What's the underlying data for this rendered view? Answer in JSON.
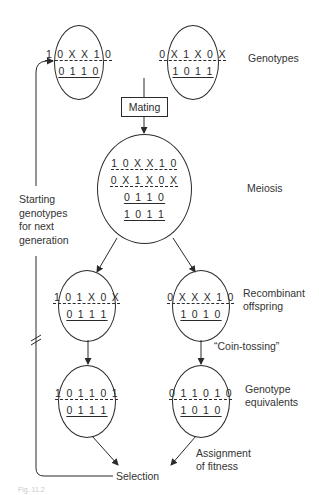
{
  "diagram": {
    "parents": {
      "left": {
        "chromosome": "1 0 X X 1 0",
        "phenotype": "0 1 1 0"
      },
      "right": {
        "chromosome": "0 X 1 X 0 X",
        "phenotype": "1 0 1 1"
      },
      "label": "Genotypes"
    },
    "mating": {
      "label": "Mating"
    },
    "meiosis": {
      "lines": [
        "1 0 X X 1 0",
        "0 X 1 X 0 X",
        "0 1 1 0",
        "1 0 1 1"
      ],
      "label": "Meiosis"
    },
    "offspring": {
      "left": {
        "chromosome": "1 0 1 X 0 X",
        "phenotype": "0 1 1 1"
      },
      "right": {
        "chromosome": "0 X X X 1 0",
        "phenotype": "1 0 1 0"
      },
      "label_line1": "Recombinant",
      "label_line2": "offspring"
    },
    "coin_tossing": {
      "label": "“Coin-tossing”"
    },
    "equivalents": {
      "left": {
        "chromosome": "1 0 1 1 0 1",
        "phenotype": "0 1 1 1"
      },
      "right": {
        "chromosome": "0 1 1 0 1 0",
        "phenotype": "1 0 1 0"
      },
      "label_line1": "Genotype",
      "label_line2": "equivalents"
    },
    "fitness": {
      "label_line1": "Assignment",
      "label_line2": "of fitness"
    },
    "selection": {
      "label": "Selection"
    },
    "feedback": {
      "line1": "Starting",
      "line2": "genotypes",
      "line3": "for next",
      "line4": "generation"
    },
    "caption": "Fig. 11.2"
  }
}
